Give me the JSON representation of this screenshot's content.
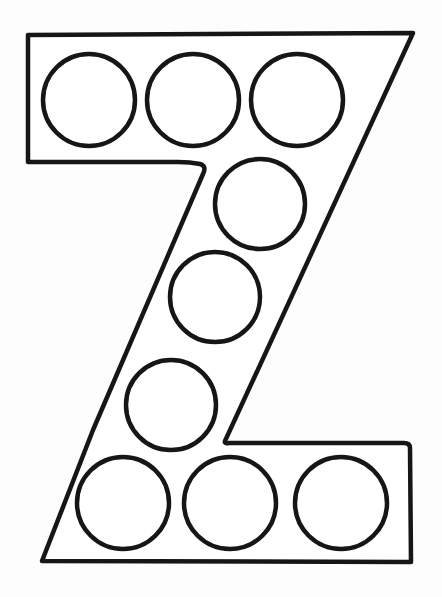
{
  "worksheet": {
    "letter": "Z",
    "colors": {
      "background": "#ffffff",
      "stroke": "#161616"
    },
    "outline_points": "28,35 413,33 225,441 408,443 411,562 42,561 93,430 200,172 208,165 190,162 28,162",
    "circles": [
      {
        "cx": 89,
        "cy": 100,
        "r": 46
      },
      {
        "cx": 193,
        "cy": 100,
        "r": 46
      },
      {
        "cx": 297,
        "cy": 100,
        "r": 46
      },
      {
        "cx": 260,
        "cy": 204,
        "r": 45
      },
      {
        "cx": 215,
        "cy": 297,
        "r": 45
      },
      {
        "cx": 171,
        "cy": 405,
        "r": 45
      },
      {
        "cx": 123,
        "cy": 503,
        "r": 46
      },
      {
        "cx": 230,
        "cy": 503,
        "r": 46
      },
      {
        "cx": 341,
        "cy": 503,
        "r": 46
      }
    ]
  }
}
